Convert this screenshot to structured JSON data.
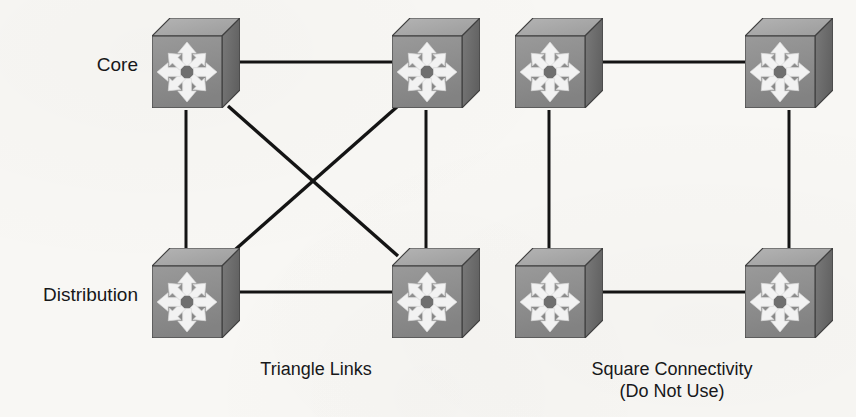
{
  "page": {
    "background_color": "#f8f7f4",
    "width": 856,
    "height": 417
  },
  "palette": {
    "link_color": "#141414",
    "text_color": "#17181a",
    "switch_front": "#8e8e8e",
    "switch_top": "#a7a7a7",
    "switch_side": "#6e6e6e",
    "switch_outline": "#3f3f3f",
    "arrow_fill": "#f2f2f2",
    "arrow_outline": "#d8d8d8"
  },
  "tier_labels": [
    {
      "id": "core",
      "text": "Core",
      "x": 138,
      "y": 55
    },
    {
      "id": "distribution",
      "text": "Distribution",
      "x": 138,
      "y": 285
    }
  ],
  "diagrams": [
    {
      "id": "triangle-links",
      "caption": "Triangle Links",
      "caption_lines": [
        "Triangle Links"
      ],
      "caption_x": 316,
      "caption_y": 358,
      "recommended": true,
      "nodes": [
        {
          "id": "tri-core-left",
          "role": "core",
          "label": "Core switch left",
          "x": 152,
          "y": 18
        },
        {
          "id": "tri-core-right",
          "role": "core",
          "label": "Core switch right",
          "x": 392,
          "y": 18
        },
        {
          "id": "tri-dist-left",
          "role": "distribution",
          "label": "Distribution switch left",
          "x": 152,
          "y": 248
        },
        {
          "id": "tri-dist-right",
          "role": "distribution",
          "label": "Distribution switch right",
          "x": 392,
          "y": 248
        }
      ],
      "links": [
        {
          "id": "tri-core-top",
          "from": "tri-core-left",
          "to": "tri-core-right",
          "kind": "horizontal",
          "x1": 240,
          "y1": 62,
          "x2": 392,
          "y2": 62
        },
        {
          "id": "tri-left-side",
          "from": "tri-core-left",
          "to": "tri-dist-left",
          "kind": "vertical",
          "x1": 186,
          "y1": 110,
          "x2": 186,
          "y2": 250
        },
        {
          "id": "tri-right-side",
          "from": "tri-core-right",
          "to": "tri-dist-right",
          "kind": "vertical",
          "x1": 426,
          "y1": 110,
          "x2": 426,
          "y2": 250
        },
        {
          "id": "tri-dist-bottom",
          "from": "tri-dist-left",
          "to": "tri-dist-right",
          "kind": "horizontal",
          "x1": 240,
          "y1": 292,
          "x2": 392,
          "y2": 292
        },
        {
          "id": "tri-diagonal-a",
          "from": "tri-core-left",
          "to": "tri-dist-right",
          "kind": "diagonal",
          "x1": 228,
          "y1": 106,
          "x2": 398,
          "y2": 256
        },
        {
          "id": "tri-diagonal-b",
          "from": "tri-core-right",
          "to": "tri-dist-left",
          "kind": "diagonal",
          "x1": 398,
          "y1": 106,
          "x2": 228,
          "y2": 256
        }
      ]
    },
    {
      "id": "square-connectivity",
      "caption": "Square Connectivity (Do Not Use)",
      "caption_lines": [
        "Square Connectivity",
        "(Do Not Use)"
      ],
      "caption_x": 672,
      "caption_y": 358,
      "recommended": false,
      "nodes": [
        {
          "id": "sq-core-left",
          "role": "core",
          "label": "Core switch left",
          "x": 515,
          "y": 18
        },
        {
          "id": "sq-core-right",
          "role": "core",
          "label": "Core switch right",
          "x": 745,
          "y": 18
        },
        {
          "id": "sq-dist-left",
          "role": "distribution",
          "label": "Distribution switch left",
          "x": 515,
          "y": 248
        },
        {
          "id": "sq-dist-right",
          "role": "distribution",
          "label": "Distribution switch right",
          "x": 745,
          "y": 248
        }
      ],
      "links": [
        {
          "id": "sq-core-top",
          "from": "sq-core-left",
          "to": "sq-core-right",
          "kind": "horizontal",
          "x1": 603,
          "y1": 62,
          "x2": 745,
          "y2": 62
        },
        {
          "id": "sq-left-side",
          "from": "sq-core-left",
          "to": "sq-dist-left",
          "kind": "vertical",
          "x1": 549,
          "y1": 110,
          "x2": 549,
          "y2": 250
        },
        {
          "id": "sq-right-side",
          "from": "sq-core-right",
          "to": "sq-dist-right",
          "kind": "vertical",
          "x1": 789,
          "y1": 110,
          "x2": 789,
          "y2": 250
        },
        {
          "id": "sq-dist-bottom",
          "from": "sq-dist-left",
          "to": "sq-dist-right",
          "kind": "horizontal",
          "x1": 603,
          "y1": 292,
          "x2": 745,
          "y2": 292
        }
      ]
    }
  ],
  "switch_icon": {
    "name": "multilayer-switch-icon",
    "description": "3D cube with eight white arrows radiating outward",
    "width": 88,
    "height": 90,
    "arrow_count": 8
  }
}
